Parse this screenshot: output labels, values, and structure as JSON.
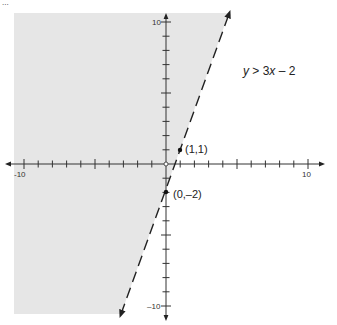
{
  "chart_data": {
    "type": "line",
    "title": "",
    "inequality": "y > 3x – 2",
    "boundary_line": {
      "slope": 3,
      "intercept": -2,
      "style": "dashed"
    },
    "shaded_region": "left of / above the line (y > 3x - 2)",
    "points": [
      {
        "label": "(1,1)",
        "x": 1,
        "y": 1
      },
      {
        "label": "(0,–2)",
        "x": 0,
        "y": -2
      }
    ],
    "x_axis": {
      "min": -10,
      "max": 10,
      "tick_step": 1,
      "labeled_ticks": [
        "-10",
        "10"
      ]
    },
    "y_axis": {
      "min": -10,
      "max": 10,
      "tick_step": 1,
      "labeled_ticks": [
        "10",
        "–10"
      ]
    },
    "xlabel": "",
    "ylabel": "",
    "grid": false,
    "colors": {
      "shade": "#e6e6e6",
      "axis": "#333333",
      "line": "#222222"
    }
  },
  "labels": {
    "equation": "y > 3x – 2",
    "p1": "(1,1)",
    "p2": "(0,–2)",
    "x_min": "-10",
    "x_max": "10",
    "y_max": "10",
    "y_min": "–10",
    "header_fragment": "..."
  }
}
